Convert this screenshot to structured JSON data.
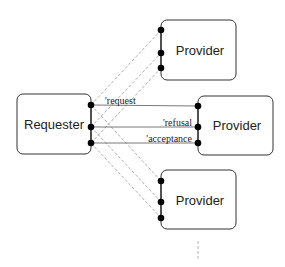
{
  "diagram": {
    "nodes": {
      "requester": {
        "label": "Requester"
      },
      "provider_top": {
        "label": "Provider"
      },
      "provider_middle": {
        "label": "Provider"
      },
      "provider_bottom": {
        "label": "Provider"
      }
    },
    "messages": {
      "request": "'request",
      "refusal": "'refusal",
      "acceptance": "'acceptance"
    },
    "continuation_indicator": "dashed-vertical-ellipsis"
  }
}
